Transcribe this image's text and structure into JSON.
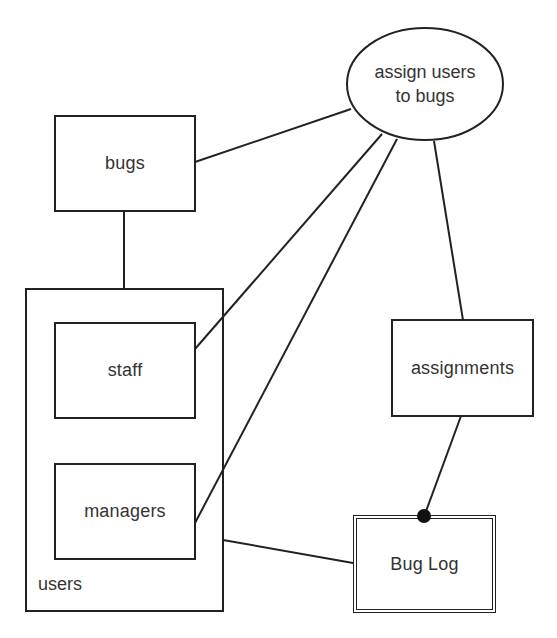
{
  "diagram": {
    "type": "entity-relationship",
    "nodes": {
      "process": {
        "label_line1": "assign users",
        "label_line2": "to bugs",
        "shape": "ellipse"
      },
      "bugs": {
        "label": "bugs",
        "shape": "rectangle"
      },
      "users": {
        "label": "users",
        "shape": "container"
      },
      "staff": {
        "label": "staff",
        "shape": "rectangle"
      },
      "managers": {
        "label": "managers",
        "shape": "rectangle"
      },
      "assignments": {
        "label": "assignments",
        "shape": "rectangle"
      },
      "bug_log": {
        "label": "Bug Log",
        "shape": "double-rectangle"
      }
    },
    "edges": [
      {
        "from": "bugs",
        "to": "assign users to bugs"
      },
      {
        "from": "bugs",
        "to": "users"
      },
      {
        "from": "staff",
        "to": "assign users to bugs"
      },
      {
        "from": "managers",
        "to": "assign users to bugs"
      },
      {
        "from": "assign users to bugs",
        "to": "assignments"
      },
      {
        "from": "assignments",
        "to": "Bug Log",
        "end_marker": "filled-dot"
      },
      {
        "from": "users",
        "to": "Bug Log"
      }
    ],
    "colors": {
      "stroke": "#222222",
      "text": "#333333",
      "background": "#ffffff"
    }
  }
}
